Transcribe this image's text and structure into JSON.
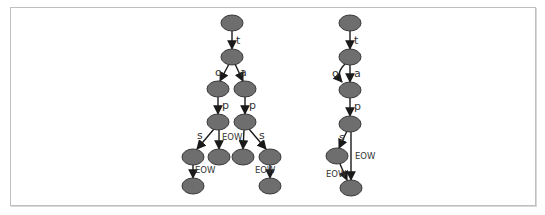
{
  "diagram": {
    "colors": {
      "node_fill": "#6e6e6e",
      "node_stroke": "#3a3a3a",
      "edge": "#1a1a1a",
      "frame": "#bfbfbf"
    },
    "left_tree": {
      "title": "trie",
      "edges": [
        {
          "from": "n1",
          "to": "n2",
          "label": "t"
        },
        {
          "from": "n2",
          "to": "n3",
          "label": "o"
        },
        {
          "from": "n2",
          "to": "n4",
          "label": "a"
        },
        {
          "from": "n3",
          "to": "n5",
          "label": "p"
        },
        {
          "from": "n4",
          "to": "n6",
          "label": "p"
        },
        {
          "from": "n5",
          "to": "n7",
          "label": "s"
        },
        {
          "from": "n5",
          "to": "n8",
          "label": "EOW"
        },
        {
          "from": "n6",
          "to": "n9",
          "label": ""
        },
        {
          "from": "n6",
          "to": "n10",
          "label": "s"
        },
        {
          "from": "n7",
          "to": "n11",
          "label": "EOW"
        },
        {
          "from": "n10",
          "to": "n12",
          "label": "EOW"
        }
      ],
      "labels": {
        "t": "t",
        "o": "o",
        "a": "a",
        "p1": "p",
        "p2": "p",
        "s1": "s",
        "eow1": "EOW",
        "s2": "s",
        "eow2": "EOW",
        "eow3": "EOW"
      }
    },
    "right_tree": {
      "title": "dawg",
      "edges": [
        {
          "from": "m1",
          "to": "m2",
          "label": "t"
        },
        {
          "from": "m2",
          "to": "m3",
          "label": "o"
        },
        {
          "from": "m2",
          "to": "m3",
          "label": "a"
        },
        {
          "from": "m3",
          "to": "m4",
          "label": "p"
        },
        {
          "from": "m4",
          "to": "m5",
          "label": "s"
        },
        {
          "from": "m4",
          "to": "m6",
          "label": "EOW"
        },
        {
          "from": "m5",
          "to": "m6",
          "label": "EOW"
        }
      ],
      "labels": {
        "t": "t",
        "o": "o",
        "a": "a",
        "p": "p",
        "s": "s",
        "eow1": "EOW",
        "eow2": "EOW"
      }
    }
  }
}
